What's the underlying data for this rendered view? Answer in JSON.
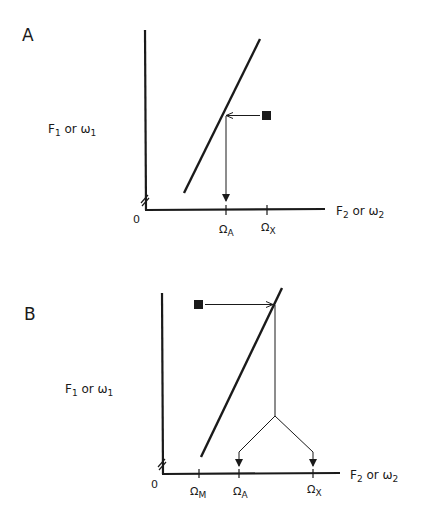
{
  "figure": {
    "colors": {
      "ink": "#1a1a1a",
      "background": "#ffffff"
    },
    "panels": [
      {
        "letter": "A",
        "y_label": {
          "main": "F",
          "sub": "1",
          "mid": " or ω",
          "sub2": "1"
        },
        "x_label": {
          "main": "F",
          "sub": "2",
          "mid": " or ω",
          "sub2": "2"
        },
        "origin": "0",
        "ticks": [
          {
            "symbol": "Ω",
            "sub": "A"
          },
          {
            "symbol": "Ω",
            "sub": "X"
          }
        ],
        "marker": "filled-square"
      },
      {
        "letter": "B",
        "y_label": {
          "main": "F",
          "sub": "1",
          "mid": " or ω",
          "sub2": "1"
        },
        "x_label": {
          "main": "F",
          "sub": "2",
          "mid": " or ω",
          "sub2": "2"
        },
        "origin": "0",
        "ticks": [
          {
            "symbol": "Ω",
            "sub": "M"
          },
          {
            "symbol": "Ω",
            "sub": "A"
          },
          {
            "symbol": "Ω",
            "sub": "X"
          }
        ],
        "marker": "filled-square"
      }
    ]
  }
}
